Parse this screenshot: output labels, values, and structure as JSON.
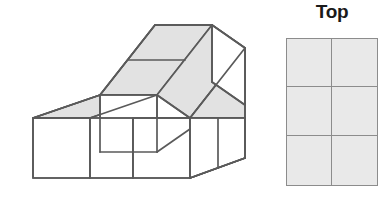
{
  "figure": {
    "label_top": "Top",
    "colors": {
      "top_face": "#e2e2e2",
      "side_face": "#ffffff",
      "front_face": "#ffffff",
      "stroke": "#5a5a5a",
      "grid_fill": "#e9e9e9",
      "grid_stroke": "#8c8c8c",
      "text": "#1a1a1a",
      "background": "#ffffff"
    },
    "block_structure": {
      "description": "isometric stepped arrangement of unit cubes",
      "depth_rows": 2,
      "width_columns": 3,
      "step_heights": [
        2,
        2,
        1
      ]
    },
    "grid": {
      "rows": 3,
      "columns": 2,
      "cells": [
        [
          "filled",
          "filled"
        ],
        [
          "filled",
          "filled"
        ],
        [
          "filled",
          "filled"
        ]
      ]
    }
  }
}
